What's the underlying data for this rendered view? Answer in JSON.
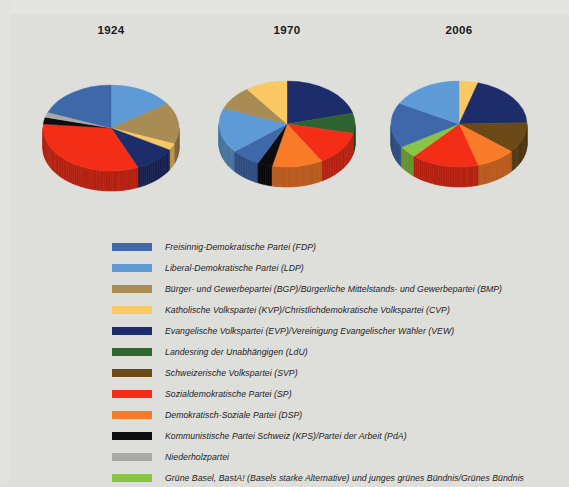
{
  "figure": {
    "background_color": "#dededa",
    "charts": [
      {
        "title": "1924",
        "center": [
          111,
          128
        ],
        "rx": 68,
        "ry": 43,
        "depth": 20
      },
      {
        "title": "1970",
        "center": [
          287,
          124
        ],
        "rx": 68,
        "ry": 43,
        "depth": 20
      },
      {
        "title": "2006",
        "center": [
          459,
          124
        ],
        "rx": 68,
        "ry": 43,
        "depth": 20
      }
    ]
  },
  "legend": {
    "items": [
      {
        "color": "#3f68ab",
        "label": "Freisinnig-Demokratische Partei (FDP)"
      },
      {
        "color": "#5e9bd6",
        "label": "Liberal-Demokratische Partei (LDP)"
      },
      {
        "color": "#a98b54",
        "label": "Bürger- und Gewerbepartei (BGP)/Bürgerliche Mittelstands- und Gewerbepartei (BMP)"
      },
      {
        "color": "#fac863",
        "label": "Katholische Volkspartei (KVP)/Christlichdemokratische Volkspartei (CVP)"
      },
      {
        "color": "#1d2d6b",
        "label": "Evangelische Volkspartei (EVP)/Vereinigung Evangelischer Wähler (VEW)"
      },
      {
        "color": "#2f6430",
        "label": "Landesring der Unabhängigen (LdU)"
      },
      {
        "color": "#6b4a18",
        "label": "Schweizerische Volkspartei (SVP)"
      },
      {
        "color": "#f42d16",
        "label": "Sozialdemokratische Partei (SP)"
      },
      {
        "color": "#f97b28",
        "label": "Demokratisch-Soziale Partei (DSP)"
      },
      {
        "color": "#0d0d0d",
        "label": "Kommunistische Partei Schweiz (KPS)/Partei der Arbeit (PdA)"
      },
      {
        "color": "#a8a8a4",
        "label": "Niederholzpartei"
      },
      {
        "color": "#88c council",
        "label": ""
      }
    ]
  },
  "chart_data": [
    {
      "type": "pie",
      "title": "1924",
      "labels": [
        "Liberal-Demokratische Partei (LDP)",
        "Bürger- und Gewerbepartei (BGP)/Bürgerliche Mittelstands- und Gewerbepartei (BMP)",
        "Katholische Volkspartei (KVP)/Christlichdemokratische Volkspartei (CVP)",
        "Evangelische Volkspartei (EVP)/Vereinigung Evangelischer Wähler (VEW)",
        "Sozialdemokratische Partei (SP)",
        "Kommunistische Partei Schweiz (KPS)/Partei der Arbeit (PdA)",
        "Niederholzpartei",
        "Freisinnig-Demokratische Partei (FDP)"
      ],
      "colors": [
        "#5e9bd6",
        "#a98b54",
        "#fac863",
        "#1d2d6b",
        "#f42d16",
        "#0d0d0d",
        "#a8a8a4",
        "#3f68ab"
      ],
      "values": [
        15.5,
        15.5,
        2.5,
        10.0,
        33.0,
        2.5,
        2.0,
        19.0
      ],
      "start_angle": 0,
      "legend_position": "below"
    },
    {
      "type": "pie",
      "title": "1970",
      "labels": [
        "Evangelische Volkspartei (EVP)/Vereinigung Evangelischer Wähler (VEW)",
        "Landesring der Unabhängigen (LdU)",
        "Sozialdemokratische Partei (SP)",
        "Demokratisch-Soziale Partei (DSP)",
        "Kommunistische Partei Schweiz (KPS)/Partei der Arbeit (PdA)",
        "Freisinnig-Demokratische Partei (FDP)",
        "Liberal-Demokratische Partei (LDP)",
        "Bürger- und Gewerbepartei (BGP)/Bürgerliche Mittelstands- und Gewerbepartei (BMP)",
        "Katholische Volkspartei (KVP)/Christlichdemokratische Volkspartei (CVP)"
      ],
      "colors": [
        "#1d2d6b",
        "#2f6430",
        "#f42d16",
        "#f97b28",
        "#0d0d0d",
        "#3f68ab",
        "#5e9bd6",
        "#a98b54",
        "#fac863"
      ],
      "values": [
        21.0,
        7.5,
        13.0,
        12.0,
        3.5,
        7.0,
        17.0,
        9.0,
        10.0
      ],
      "start_angle": 0,
      "legend_position": "below"
    },
    {
      "type": "pie",
      "title": "2006",
      "labels": [
        "Katholische Volkspartei (KVP)/Christlichdemokratische Volkspartei (CVP)",
        "Evangelische Volkspartei (EVP)/Vereinigung Evangelischer Wähler (VEW)",
        "Schweizerische Volkspartei (SVP)",
        "Demokratisch-Soziale Partei (DSP)",
        "Sozialdemokratische Partei (SP)",
        "Grüne Basel, BastA! (Basels starke Alternative) und junges grünes Bündnis/Grünes Bündnis",
        "Freisinnig-Demokratische Partei (FDP)",
        "Liberal-Demokratische Partei (LDP)"
      ],
      "colors": [
        "#fac863",
        "#1d2d6b",
        "#6b4a18",
        "#f97b28",
        "#f42d16",
        "#88c544",
        "#3f68ab",
        "#5e9bd6"
      ],
      "values": [
        4.5,
        20.0,
        11.5,
        9.5,
        16.0,
        4.5,
        17.0,
        17.0
      ],
      "start_angle": 0,
      "legend_position": "below"
    }
  ],
  "legend_items": [
    {
      "color": "#3f68ab",
      "label": "Freisinnig-Demokratische Partei (FDP)"
    },
    {
      "color": "#5e9bd6",
      "label": "Liberal-Demokratische Partei (LDP)"
    },
    {
      "color": "#a98b54",
      "label": "Bürger- und Gewerbepartei (BGP)/Bürgerliche Mittelstands- und Gewerbepartei (BMP)"
    },
    {
      "color": "#fac863",
      "label": "Katholische Volkspartei (KVP)/Christlichdemokratische Volkspartei (CVP)"
    },
    {
      "color": "#1d2d6b",
      "label": "Evangelische Volkspartei (EVP)/Vereinigung Evangelischer Wähler (VEW)"
    },
    {
      "color": "#2f6430",
      "label": "Landesring der Unabhängigen (LdU)"
    },
    {
      "color": "#6b4a18",
      "label": "Schweizerische Volkspartei (SVP)"
    },
    {
      "color": "#f42d16",
      "label": "Sozialdemokratische Partei (SP)"
    },
    {
      "color": "#f97b28",
      "label": "Demokratisch-Soziale Partei (DSP)"
    },
    {
      "color": "#0d0d0d",
      "label": "Kommunistische Partei Schweiz (KPS)/Partei der Arbeit (PdA)"
    },
    {
      "color": "#a8a8a4",
      "label": "Niederholzpartei"
    },
    {
      "color": "#88c544",
      "label": "Grüne Basel, BastA! (Basels starke Alternative) und junges grünes Bündnis/Grünes Bündnis"
    }
  ]
}
